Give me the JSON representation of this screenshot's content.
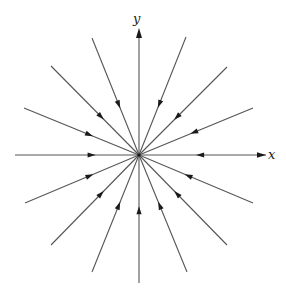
{
  "diagram": {
    "type": "phase-portrait",
    "origin": {
      "x": 139,
      "y": 155
    },
    "colors": {
      "line": "#555555",
      "arrow": "#1a1a1a",
      "background": "#ffffff"
    },
    "axes": {
      "x": {
        "label": "x",
        "from": [
          15,
          155
        ],
        "to": [
          262,
          155
        ],
        "arrow_tip": [
          266,
          155
        ]
      },
      "y": {
        "label": "y",
        "from": [
          139,
          283
        ],
        "to": [
          139,
          34
        ],
        "arrow_tip": [
          139,
          28
        ]
      }
    },
    "rays": [
      {
        "name": "ray-0deg",
        "angle_deg": 0,
        "outer": [
          266,
          155
        ],
        "arrow_at": 0.55
      },
      {
        "name": "ray-22deg",
        "angle_deg": 22.5,
        "outer": [
          253,
          108
        ],
        "arrow_at": 0.55
      },
      {
        "name": "ray-45deg",
        "angle_deg": 45,
        "outer": [
          227,
          67
        ],
        "arrow_at": 0.6
      },
      {
        "name": "ray-67deg",
        "angle_deg": 67.5,
        "outer": [
          186,
          37
        ],
        "arrow_at": 0.6
      },
      {
        "name": "ray-112deg",
        "angle_deg": 112.5,
        "outer": [
          92,
          38
        ],
        "arrow_at": 0.6
      },
      {
        "name": "ray-135deg",
        "angle_deg": 135,
        "outer": [
          51,
          66
        ],
        "arrow_at": 0.6
      },
      {
        "name": "ray-157deg",
        "angle_deg": 157.5,
        "outer": [
          24,
          108
        ],
        "arrow_at": 0.6
      },
      {
        "name": "ray-180deg",
        "angle_deg": 180,
        "outer": [
          15,
          155
        ],
        "arrow_at": 0.65
      },
      {
        "name": "ray-202deg",
        "angle_deg": 202.5,
        "outer": [
          25,
          203
        ],
        "arrow_at": 0.6
      },
      {
        "name": "ray-225deg",
        "angle_deg": 225,
        "outer": [
          51,
          245
        ],
        "arrow_at": 0.6
      },
      {
        "name": "ray-247deg",
        "angle_deg": 247.5,
        "outer": [
          92,
          272
        ],
        "arrow_at": 0.6
      },
      {
        "name": "ray-270deg",
        "angle_deg": 270,
        "outer": [
          139,
          283
        ],
        "arrow_at": 0.6
      },
      {
        "name": "ray-292deg",
        "angle_deg": 292.5,
        "outer": [
          187,
          272
        ],
        "arrow_at": 0.6
      },
      {
        "name": "ray-315deg",
        "angle_deg": 315,
        "outer": [
          227,
          245
        ],
        "arrow_at": 0.6
      },
      {
        "name": "ray-337deg",
        "angle_deg": 337.5,
        "outer": [
          253,
          203
        ],
        "arrow_at": 0.6
      }
    ]
  }
}
